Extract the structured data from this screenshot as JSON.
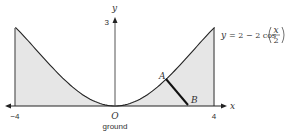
{
  "diagram": {
    "type": "function-graph",
    "equation": {
      "lhs": "y",
      "rhs_prefix": "= 2 − 2 cos",
      "frac_num": "x",
      "frac_den": "2"
    },
    "axes": {
      "x_label": "x",
      "y_label": "y",
      "origin_label": "O",
      "ground_label": "ground"
    },
    "ticks": {
      "x_left": "−4",
      "x_right": "4",
      "y_top": "3"
    },
    "points": [
      {
        "label": "A",
        "x": 2.04
      },
      {
        "label": "B",
        "x": 2.9
      }
    ],
    "domain": [
      -4,
      4
    ],
    "colors": {
      "fill": "#e6e6e6",
      "curve": "#222222",
      "segment": "#111111"
    }
  }
}
